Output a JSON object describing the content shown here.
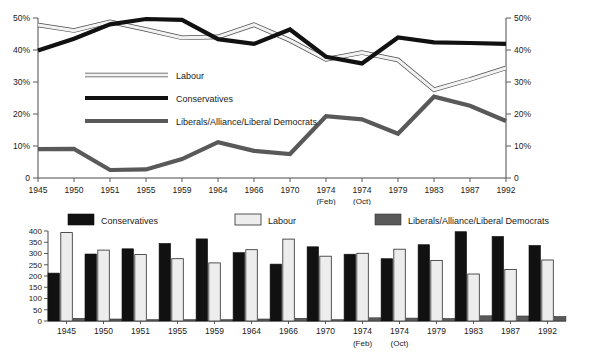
{
  "chart_data": [
    {
      "type": "line",
      "title": "",
      "xlabel": "",
      "ylabel": "",
      "ylim": [
        0,
        50
      ],
      "y_unit": "%",
      "grid": false,
      "dual_axis": true,
      "left_axis_ticks": [
        "0",
        "10%",
        "20%",
        "30%",
        "40%",
        "50%"
      ],
      "right_axis_ticks": [
        "0",
        "10%",
        "20%",
        "30%",
        "40%",
        "50%"
      ],
      "legend_position": "inside-left",
      "categories": [
        "1945",
        "1950",
        "1951",
        "1955",
        "1959",
        "1964",
        "1966",
        "1970",
        "1974",
        "1974",
        "1979",
        "1983",
        "1987",
        "1992"
      ],
      "category_sublabels": [
        "",
        "",
        "",
        "",
        "",
        "",
        "",
        "",
        "(Feb)",
        "(Oct)",
        "",
        "",
        "",
        ""
      ],
      "series": [
        {
          "name": "Labour",
          "color": "#f2f2f2",
          "outline": "#4d4d4d",
          "values": [
            47.8,
            46.1,
            48.8,
            46.4,
            43.8,
            44.1,
            47.9,
            43.0,
            37.1,
            39.2,
            36.9,
            27.6,
            30.8,
            34.4
          ]
        },
        {
          "name": "Conservatives",
          "color": "#111111",
          "values": [
            39.8,
            43.5,
            48.0,
            49.7,
            49.4,
            43.4,
            41.9,
            46.4,
            37.9,
            35.8,
            43.9,
            42.4,
            42.2,
            41.9
          ]
        },
        {
          "name": "Liberals/Alliance/Liberal Democrats",
          "color": "#595959",
          "values": [
            9.0,
            9.1,
            2.5,
            2.7,
            5.9,
            11.2,
            8.5,
            7.5,
            19.3,
            18.3,
            13.8,
            25.4,
            22.6,
            17.8
          ]
        }
      ]
    },
    {
      "type": "bar",
      "title": "",
      "xlabel": "",
      "ylabel": "",
      "ylim": [
        0,
        400
      ],
      "y_ticks": [
        "0",
        "50",
        "100",
        "150",
        "200",
        "250",
        "300",
        "350",
        "400"
      ],
      "grid": false,
      "legend_position": "top",
      "categories": [
        "1945",
        "1950",
        "1951",
        "1955",
        "1959",
        "1964",
        "1966",
        "1970",
        "1974",
        "1974",
        "1979",
        "1983",
        "1987",
        "1992"
      ],
      "category_sublabels": [
        "",
        "",
        "",
        "",
        "",
        "",
        "",
        "",
        "(Feb)",
        "(Oct)",
        "",
        "",
        "",
        ""
      ],
      "series": [
        {
          "name": "Conservatives",
          "color": "#111111",
          "values": [
            213,
            298,
            321,
            345,
            365,
            304,
            253,
            330,
            297,
            277,
            339,
            397,
            376,
            336
          ]
        },
        {
          "name": "Labour",
          "color": "#ededed",
          "values": [
            393,
            315,
            295,
            277,
            258,
            317,
            364,
            288,
            301,
            319,
            269,
            209,
            229,
            271
          ]
        },
        {
          "name": "Liberals/Alliance/Liberal Democrats",
          "color": "#595959",
          "values": [
            12,
            9,
            6,
            6,
            6,
            9,
            12,
            6,
            14,
            13,
            11,
            23,
            22,
            20
          ]
        }
      ]
    }
  ],
  "line_chart": {
    "legend": [
      {
        "label": "Labour",
        "swatch": "labour-line-swatch"
      },
      {
        "label": "Conservatives",
        "swatch": "conservatives-line-swatch"
      },
      {
        "label": "Liberals/Alliance/Liberal Democrats",
        "swatch": "liberals-line-swatch"
      }
    ],
    "y_left": [
      "50%",
      "40%",
      "30%",
      "20%",
      "10%",
      "0"
    ],
    "y_right": [
      "50%",
      "40%",
      "30%",
      "20%",
      "10%",
      "0"
    ],
    "x_labels": [
      "1945",
      "1950",
      "1951",
      "1955",
      "1959",
      "1964",
      "1966",
      "1970",
      "1974",
      "1974",
      "1979",
      "1983",
      "1987",
      "1992"
    ],
    "x_sublabels": [
      "",
      "",
      "",
      "",
      "",
      "",
      "",
      "",
      "(Feb)",
      "(Oct)",
      "",
      "",
      "",
      ""
    ]
  },
  "bar_chart": {
    "legend": [
      {
        "label": "Conservatives",
        "swatch": "conservatives-bar-swatch"
      },
      {
        "label": "Labour",
        "swatch": "labour-bar-swatch"
      },
      {
        "label": "Liberals/Alliance/Liberal Democrats",
        "swatch": "liberals-bar-swatch"
      }
    ],
    "y_ticks": [
      "400",
      "350",
      "300",
      "250",
      "200",
      "150",
      "100",
      "50",
      "0"
    ],
    "x_labels": [
      "1945",
      "1950",
      "1951",
      "1955",
      "1959",
      "1964",
      "1966",
      "1970",
      "1974",
      "1974",
      "1979",
      "1983",
      "1987",
      "1992"
    ],
    "x_sublabels": [
      "",
      "",
      "",
      "",
      "",
      "",
      "",
      "",
      "(Feb)",
      "(Oct)",
      "",
      "",
      "",
      ""
    ]
  }
}
